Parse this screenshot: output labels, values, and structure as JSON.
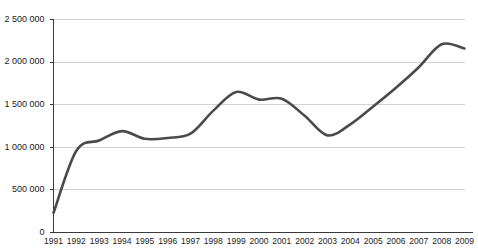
{
  "chart_data": {
    "type": "line",
    "title": "",
    "subtitle": "",
    "xlabel": "",
    "ylabel": "",
    "grid": true,
    "legend": false,
    "legend_position": "none",
    "line_color": "#4a4a4a",
    "grid_color": "#c8c8c8",
    "axis_color": "#3a3a3a",
    "background_color": "#ffffff",
    "xlim": [
      1991,
      2009
    ],
    "ylim": [
      0,
      2500000
    ],
    "ytick_values": [
      0,
      500000,
      1000000,
      1500000,
      2000000,
      2500000
    ],
    "ytick_labels": [
      "0",
      "500 000",
      "1 000 000",
      "1 500 000",
      "2 000 000",
      "2 500 000"
    ],
    "categories": [
      "1991",
      "1992",
      "1993",
      "1994",
      "1995",
      "1996",
      "1997",
      "1998",
      "1999",
      "2000",
      "2001",
      "2002",
      "2003",
      "2004",
      "2005",
      "2006",
      "2007",
      "2008",
      "2009"
    ],
    "x": [
      1991,
      1992,
      1993,
      1994,
      1995,
      1996,
      1997,
      1998,
      1999,
      2000,
      2001,
      2002,
      2003,
      2004,
      2005,
      2006,
      2007,
      2008,
      2009
    ],
    "values": [
      230000,
      960000,
      1080000,
      1190000,
      1100000,
      1110000,
      1160000,
      1430000,
      1650000,
      1560000,
      1570000,
      1370000,
      1140000,
      1270000,
      1480000,
      1700000,
      1940000,
      2210000,
      2160000
    ],
    "series": [
      {
        "name": "series-1",
        "values": [
          230000,
          960000,
          1080000,
          1190000,
          1100000,
          1110000,
          1160000,
          1430000,
          1650000,
          1560000,
          1570000,
          1370000,
          1140000,
          1270000,
          1480000,
          1700000,
          1940000,
          2210000,
          2160000
        ]
      }
    ]
  }
}
